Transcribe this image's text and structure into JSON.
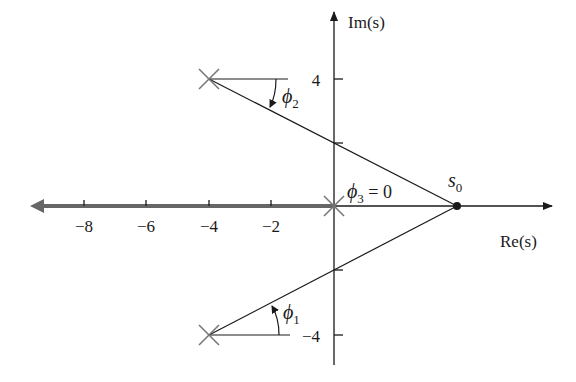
{
  "diagram": {
    "type": "root-locus-angle-diagram",
    "axes": {
      "real_label": "Re(s)",
      "imag_label": "Im(s)",
      "real_ticks": [
        "−8",
        "−6",
        "−4",
        "−2"
      ],
      "imag_ticks": [
        "4",
        "−4"
      ]
    },
    "poles": [
      {
        "re": -4,
        "im": 4
      },
      {
        "re": 0,
        "im": 0
      },
      {
        "re": -4,
        "im": -4
      }
    ],
    "test_point": {
      "label": "s",
      "sub": "0",
      "re": 4,
      "im": 0
    },
    "angles": [
      {
        "name": "phi1",
        "label": "ϕ",
        "sub": "1"
      },
      {
        "name": "phi2",
        "label": "ϕ",
        "sub": "2"
      },
      {
        "name": "phi3",
        "label": "ϕ",
        "sub": "3",
        "suffix": " = 0"
      }
    ],
    "locus_color": "#666666",
    "line_color": "#1a1a1a",
    "pole_color": "#777777"
  }
}
